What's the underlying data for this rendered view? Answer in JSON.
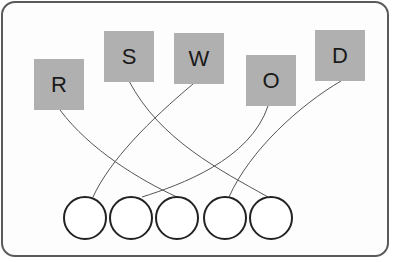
{
  "diagram": {
    "type": "matching",
    "boxes": [
      {
        "label": "R",
        "x": 34,
        "y": 59
      },
      {
        "label": "S",
        "x": 104,
        "y": 31
      },
      {
        "label": "W",
        "x": 174,
        "y": 33
      },
      {
        "label": "O",
        "x": 246,
        "y": 55
      },
      {
        "label": "D",
        "x": 315,
        "y": 30
      }
    ],
    "circles": [
      {
        "index": 1,
        "cx": 85
      },
      {
        "index": 2,
        "cx": 131
      },
      {
        "index": 3,
        "cx": 177
      },
      {
        "index": 4,
        "cx": 225
      },
      {
        "index": 5,
        "cx": 271
      }
    ],
    "connections": [
      {
        "from": "R",
        "to_circle": 3
      },
      {
        "from": "S",
        "to_circle": 5
      },
      {
        "from": "W",
        "to_circle": 1
      },
      {
        "from": "O",
        "to_circle": 2
      },
      {
        "from": "D",
        "to_circle": 4
      }
    ],
    "colors": {
      "box": "#b0b0b0",
      "line": "#555555",
      "circle_stroke": "#222222",
      "frame": "#5a5a5a"
    }
  }
}
